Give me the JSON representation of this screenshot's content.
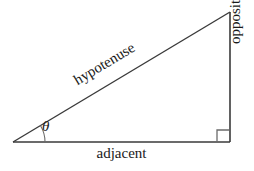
{
  "figure": {
    "background_color": "#ffffff",
    "stroke_color": "#3a3a3a",
    "text_color": "#1a1a1a",
    "labels": {
      "adjacent": "adjacent",
      "opposite": "opposite",
      "hypotenuse": "hypotenuse",
      "angle": "θ"
    },
    "geometry": {
      "left_vertex": [
        13,
        142
      ],
      "right_vertex": [
        230,
        142
      ],
      "apex": [
        230,
        12
      ],
      "angle_arc_radius": 32,
      "right_angle_marker_size": 12
    }
  }
}
